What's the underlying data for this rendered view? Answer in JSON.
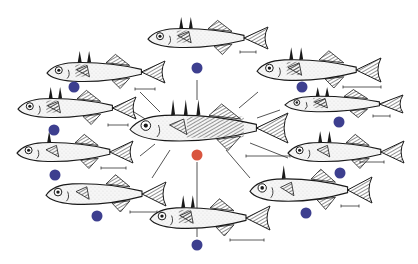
{
  "diagram": {
    "title": "",
    "colors": {
      "ancestral_marker": "#d9553f",
      "derived_marker": "#3d3f8f",
      "line": "#555555",
      "fish_outline": "#1a1a1a",
      "fish_body": "#f6f6f6"
    },
    "center": {
      "name": "ancestral-fish",
      "marker": "ancestral",
      "spines": 3,
      "armor": "full"
    },
    "satellites": [
      {
        "name": "fish-top",
        "spines": 2,
        "armor": "partial"
      },
      {
        "name": "fish-upper-left",
        "spines": 2,
        "armor": "partial"
      },
      {
        "name": "fish-mid-left",
        "spines": 2,
        "armor": "partial"
      },
      {
        "name": "fish-lower-left",
        "spines": 1,
        "armor": "low"
      },
      {
        "name": "fish-bottom-left",
        "spines": 0,
        "armor": "low"
      },
      {
        "name": "fish-bottom",
        "spines": 2,
        "armor": "partial"
      },
      {
        "name": "fish-upper-right",
        "spines": 2,
        "armor": "partial"
      },
      {
        "name": "fish-mid-right",
        "spines": 2,
        "armor": "partial"
      },
      {
        "name": "fish-lower-right",
        "spines": 2,
        "armor": "low"
      },
      {
        "name": "fish-bottom-right",
        "spines": 1,
        "armor": "low"
      }
    ]
  }
}
